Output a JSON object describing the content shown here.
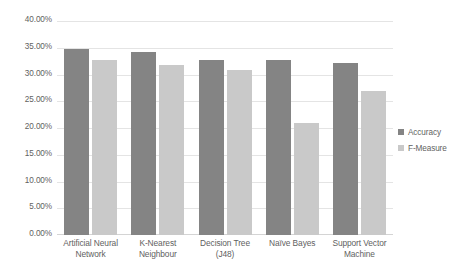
{
  "chart_data": {
    "type": "bar",
    "title": "",
    "xlabel": "",
    "ylabel": "",
    "ylim": [
      0,
      0.4
    ],
    "grid": true,
    "legend_position": "right",
    "categories": [
      "Artificial Neural Network",
      "K-Nearest Neighbour",
      "Decision Tree (J48)",
      "Naïve Bayes",
      "Support Vector Machine"
    ],
    "ytick_labels": [
      "40.00%",
      "35.00%",
      "30.00%",
      "25.00%",
      "20.00%",
      "15.00%",
      "10.00%",
      "5.00%",
      "0.00%"
    ],
    "ytick_values": [
      0.4,
      0.35,
      0.3,
      0.25,
      0.2,
      0.15,
      0.1,
      0.05,
      0.0
    ],
    "series": [
      {
        "name": "Accuracy",
        "color": "#848484",
        "values": [
          0.348,
          0.343,
          0.328,
          0.327,
          0.321
        ]
      },
      {
        "name": "F-Measure",
        "color": "#c9c9c9",
        "values": [
          0.328,
          0.317,
          0.309,
          0.21,
          0.27
        ]
      }
    ]
  },
  "legend": {
    "items": [
      {
        "label": "Accuracy"
      },
      {
        "label": "F-Measure"
      }
    ]
  }
}
